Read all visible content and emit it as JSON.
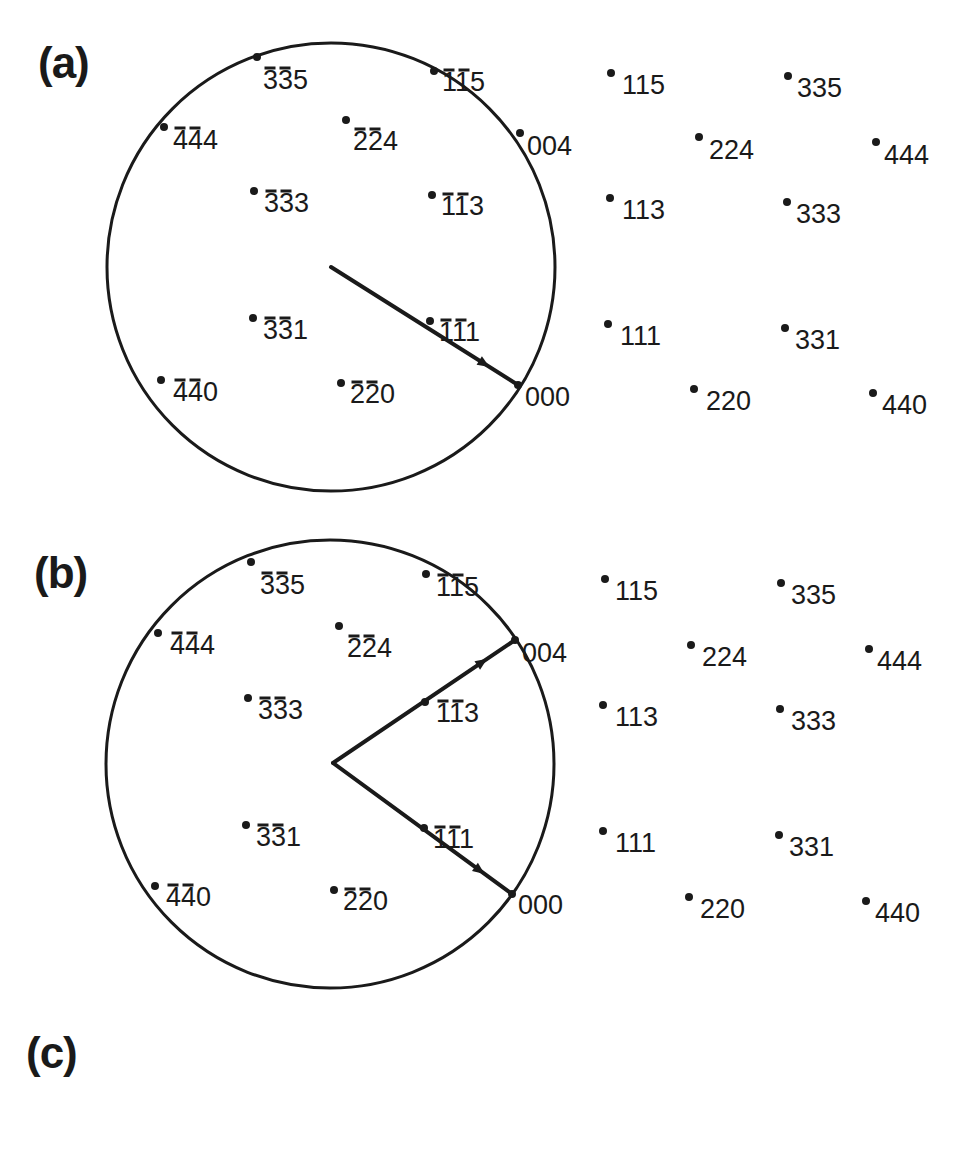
{
  "figure": {
    "panels": [
      {
        "id": "a",
        "label": "(a)",
        "label_pos": [
          38,
          38
        ],
        "circle": {
          "cx": 331,
          "cy": 267,
          "r": 224
        },
        "vectors": [
          {
            "from": [
              331,
              267
            ],
            "to": [
              518,
              385
            ],
            "arrow_at": 0.82
          }
        ],
        "points": [
          {
            "hkl": "335",
            "bars": [
              0,
              1
            ],
            "x": 257,
            "y": 57,
            "lx": 263,
            "ly": 80
          },
          {
            "hkl": "115",
            "bars": [
              0,
              1
            ],
            "x": 434,
            "y": 71,
            "lx": 442,
            "ly": 82
          },
          {
            "hkl": "444",
            "bars": [
              0,
              1
            ],
            "x": 164,
            "y": 127,
            "lx": 173,
            "ly": 140
          },
          {
            "hkl": "224",
            "bars": [
              0,
              1
            ],
            "x": 346,
            "y": 120,
            "lx": 353,
            "ly": 141
          },
          {
            "hkl": "004",
            "bars": [],
            "x": 520,
            "y": 133,
            "lx": 527,
            "ly": 146
          },
          {
            "hkl": "333",
            "bars": [
              0,
              1
            ],
            "x": 254,
            "y": 191,
            "lx": 264,
            "ly": 203
          },
          {
            "hkl": "113",
            "bars": [
              0,
              1
            ],
            "x": 432,
            "y": 195,
            "lx": 441,
            "ly": 206
          },
          {
            "hkl": "331",
            "bars": [
              0,
              1
            ],
            "x": 253,
            "y": 318,
            "lx": 263,
            "ly": 330
          },
          {
            "hkl": "111",
            "bars": [
              0,
              1
            ],
            "x": 430,
            "y": 321,
            "lx": 439,
            "ly": 332
          },
          {
            "hkl": "440",
            "bars": [
              0,
              1
            ],
            "x": 161,
            "y": 380,
            "lx": 173,
            "ly": 392
          },
          {
            "hkl": "220",
            "bars": [
              0,
              1
            ],
            "x": 341,
            "y": 383,
            "lx": 350,
            "ly": 394
          },
          {
            "hkl": "000",
            "bars": [],
            "x": 518,
            "y": 385,
            "lx": 525,
            "ly": 397
          },
          {
            "hkl": "115",
            "bars": [],
            "x": 611,
            "y": 73,
            "lx": 622,
            "ly": 85
          },
          {
            "hkl": "335",
            "bars": [],
            "x": 788,
            "y": 76,
            "lx": 797,
            "ly": 88
          },
          {
            "hkl": "224",
            "bars": [],
            "x": 699,
            "y": 137,
            "lx": 709,
            "ly": 150
          },
          {
            "hkl": "444",
            "bars": [],
            "x": 876,
            "y": 142,
            "lx": 884,
            "ly": 155
          },
          {
            "hkl": "113",
            "bars": [],
            "x": 610,
            "y": 198,
            "lx": 622,
            "ly": 210
          },
          {
            "hkl": "333",
            "bars": [],
            "x": 787,
            "y": 202,
            "lx": 796,
            "ly": 214
          },
          {
            "hkl": "111",
            "bars": [],
            "x": 608,
            "y": 324,
            "lx": 620,
            "ly": 336
          },
          {
            "hkl": "331",
            "bars": [],
            "x": 785,
            "y": 328,
            "lx": 795,
            "ly": 340
          },
          {
            "hkl": "220",
            "bars": [],
            "x": 694,
            "y": 389,
            "lx": 706,
            "ly": 401
          },
          {
            "hkl": "440",
            "bars": [],
            "x": 873,
            "y": 393,
            "lx": 882,
            "ly": 405
          }
        ]
      },
      {
        "id": "b",
        "label": "(b)",
        "label_pos": [
          34,
          548
        ],
        "circle": {
          "cx": 330,
          "cy": 764,
          "r": 224
        },
        "vectors": [
          {
            "from": [
              333,
              763
            ],
            "to": [
              515,
              640
            ],
            "arrow_at": 0.82
          },
          {
            "from": [
              333,
              763
            ],
            "to": [
              512,
              894
            ],
            "arrow_at": 0.82
          }
        ],
        "points": [
          {
            "hkl": "335",
            "bars": [
              0,
              1
            ],
            "x": 251,
            "y": 562,
            "lx": 260,
            "ly": 585
          },
          {
            "hkl": "115",
            "bars": [
              0,
              1
            ],
            "x": 426,
            "y": 574,
            "lx": 436,
            "ly": 587
          },
          {
            "hkl": "444",
            "bars": [
              0,
              1
            ],
            "x": 158,
            "y": 633,
            "lx": 170,
            "ly": 645
          },
          {
            "hkl": "224",
            "bars": [
              0,
              1
            ],
            "x": 339,
            "y": 626,
            "lx": 347,
            "ly": 648
          },
          {
            "hkl": "004",
            "bars": [],
            "x": 515,
            "y": 640,
            "lx": 522,
            "ly": 653
          },
          {
            "hkl": "333",
            "bars": [
              0,
              1
            ],
            "x": 248,
            "y": 698,
            "lx": 258,
            "ly": 710
          },
          {
            "hkl": "113",
            "bars": [
              0,
              1
            ],
            "x": 425,
            "y": 702,
            "lx": 436,
            "ly": 713
          },
          {
            "hkl": "331",
            "bars": [
              0,
              1
            ],
            "x": 246,
            "y": 825,
            "lx": 256,
            "ly": 837
          },
          {
            "hkl": "111",
            "bars": [
              0,
              1
            ],
            "x": 424,
            "y": 828,
            "lx": 433,
            "ly": 839
          },
          {
            "hkl": "440",
            "bars": [
              0,
              1
            ],
            "x": 155,
            "y": 886,
            "lx": 166,
            "ly": 897
          },
          {
            "hkl": "220",
            "bars": [
              0,
              1
            ],
            "x": 334,
            "y": 890,
            "lx": 343,
            "ly": 901
          },
          {
            "hkl": "000",
            "bars": [],
            "x": 512,
            "y": 894,
            "lx": 518,
            "ly": 905
          },
          {
            "hkl": "115",
            "bars": [],
            "x": 605,
            "y": 579,
            "lx": 615,
            "ly": 591
          },
          {
            "hkl": "335",
            "bars": [],
            "x": 781,
            "y": 583,
            "lx": 791,
            "ly": 595
          },
          {
            "hkl": "224",
            "bars": [],
            "x": 691,
            "y": 645,
            "lx": 702,
            "ly": 657
          },
          {
            "hkl": "444",
            "bars": [],
            "x": 869,
            "y": 649,
            "lx": 877,
            "ly": 661
          },
          {
            "hkl": "113",
            "bars": [],
            "x": 603,
            "y": 705,
            "lx": 615,
            "ly": 717
          },
          {
            "hkl": "333",
            "bars": [],
            "x": 780,
            "y": 709,
            "lx": 791,
            "ly": 721
          },
          {
            "hkl": "111",
            "bars": [],
            "x": 603,
            "y": 831,
            "lx": 615,
            "ly": 843
          },
          {
            "hkl": "331",
            "bars": [],
            "x": 779,
            "y": 835,
            "lx": 789,
            "ly": 847
          },
          {
            "hkl": "220",
            "bars": [],
            "x": 689,
            "y": 897,
            "lx": 700,
            "ly": 909
          },
          {
            "hkl": "440",
            "bars": [],
            "x": 866,
            "y": 901,
            "lx": 875,
            "ly": 913
          }
        ]
      },
      {
        "id": "c",
        "label": "(c)",
        "label_pos": [
          26,
          1028
        ],
        "points": []
      }
    ],
    "colors": {
      "ink": "#1a1a1a",
      "background": "#ffffff"
    }
  }
}
